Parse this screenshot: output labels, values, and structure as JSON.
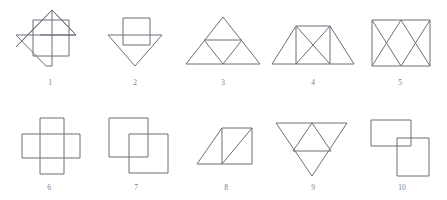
{
  "page": {
    "background_color": "#ffffff",
    "stroke_color": "#6b6f78",
    "label_color": "#7a7e86",
    "width": 447,
    "height": 200
  },
  "figures": [
    {
      "label": "1",
      "name": "square-with-rotated-z-shape",
      "description": "A square overlapped by a large rotated Z / zigzag stroke with diagonal arms extending beyond the square",
      "label_x": 50,
      "label_y": 83
    },
    {
      "label": "2",
      "name": "square-over-downward-triangle",
      "description": "A square overlapping the top of a downward-pointing triangle",
      "label_x": 135,
      "label_y": 83
    },
    {
      "label": "3",
      "name": "triangle-subdivided-four",
      "description": "A large upward triangle (trapezoid outline) subdivided into four smaller triangles",
      "label_x": 223,
      "label_y": 83
    },
    {
      "label": "4",
      "name": "trapezoid-with-crossed-square",
      "description": "A trapezoid containing a square crossed by both diagonals",
      "label_x": 313,
      "label_y": 83
    },
    {
      "label": "5",
      "name": "rectangle-with-double-bowtie",
      "description": "A rectangle containing two crossing diagonal pairs forming bowtie shapes",
      "label_x": 400,
      "label_y": 83
    },
    {
      "label": "6",
      "name": "plus-cross-two-rectangles",
      "description": "A plus / cross formed by two overlapping rectangles",
      "label_x": 49,
      "label_y": 188
    },
    {
      "label": "7",
      "name": "two-offset-overlapping-squares",
      "description": "Two equal squares offset diagonally so that their corners overlap",
      "label_x": 136,
      "label_y": 188
    },
    {
      "label": "8",
      "name": "square-with-attached-triangle",
      "description": "A square with a right triangle attached on its left, plus a diagonal in the square",
      "label_x": 226,
      "label_y": 188
    },
    {
      "label": "9",
      "name": "downward-triangle-with-inner-triangle",
      "description": "A downward-pointing triangle containing an inner upward-pointing triangle",
      "label_x": 313,
      "label_y": 188
    },
    {
      "label": "10",
      "name": "two-overlapping-rectangles-offset",
      "description": "A horizontal rectangle and a vertical rectangle overlapping at a small square",
      "label_x": 402,
      "label_y": 188
    }
  ]
}
